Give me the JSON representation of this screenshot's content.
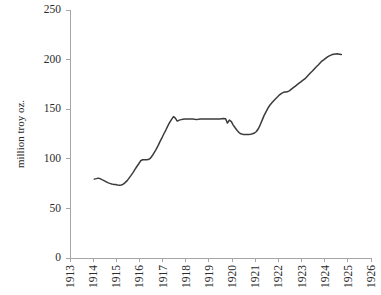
{
  "chart_data": {
    "type": "line",
    "title": "",
    "subtitle": "",
    "xlabel": "",
    "ylabel": "million troy oz.",
    "ylim": [
      0,
      250
    ],
    "xlim": [
      1913,
      1926
    ],
    "y_ticks": [
      0,
      50,
      100,
      150,
      200,
      250
    ],
    "x_ticks": [
      1913,
      1914,
      1915,
      1916,
      1917,
      1918,
      1919,
      1920,
      1921,
      1922,
      1923,
      1924,
      1925,
      1926
    ],
    "y_tick_labels": [
      "0",
      "50",
      "100",
      "150",
      "200",
      "250"
    ],
    "x_tick_labels": [
      "1913",
      "1914",
      "1915",
      "1916",
      "1917",
      "1918",
      "1919",
      "1920",
      "1921",
      "1922",
      "1923",
      "1924",
      "1925",
      "1926"
    ],
    "grid": false,
    "legend": null,
    "legend_position": "none",
    "line_color": "#3b3b3b",
    "axis_color": "#a6a6a6",
    "series": [
      {
        "name": "million troy oz.",
        "x": [
          1914.05,
          1914.14,
          1914.22,
          1914.3,
          1914.38,
          1914.47,
          1914.55,
          1914.63,
          1914.72,
          1914.8,
          1914.88,
          1914.97,
          1915.05,
          1915.14,
          1915.22,
          1915.3,
          1915.38,
          1915.47,
          1915.55,
          1915.63,
          1915.72,
          1915.8,
          1915.88,
          1915.97,
          1916.05,
          1916.14,
          1916.22,
          1916.3,
          1916.38,
          1916.47,
          1916.55,
          1916.63,
          1916.72,
          1916.8,
          1916.88,
          1916.97,
          1917.05,
          1917.14,
          1917.22,
          1917.3,
          1917.38,
          1917.47,
          1917.55,
          1917.63,
          1917.72,
          1917.8,
          1917.88,
          1917.97,
          1918.05,
          1918.14,
          1918.22,
          1918.3,
          1918.38,
          1918.47,
          1918.55,
          1918.63,
          1918.72,
          1918.8,
          1918.88,
          1918.97,
          1919.05,
          1919.14,
          1919.22,
          1919.3,
          1919.38,
          1919.47,
          1919.55,
          1919.63,
          1919.72,
          1919.8,
          1919.88,
          1919.97,
          1920.05,
          1920.14,
          1920.22,
          1920.3,
          1920.38,
          1920.47,
          1920.55,
          1920.63,
          1920.72,
          1920.8,
          1920.88,
          1920.97,
          1921.05,
          1921.14,
          1921.22,
          1921.3,
          1921.38,
          1921.47,
          1921.55,
          1921.63,
          1921.72,
          1921.8,
          1921.88,
          1921.97,
          1922.05,
          1922.14,
          1922.22,
          1922.3,
          1922.38,
          1922.47,
          1922.55,
          1922.63,
          1922.72,
          1922.8,
          1922.88,
          1922.97,
          1923.05,
          1923.14,
          1923.22,
          1923.3,
          1923.38,
          1923.47,
          1923.55,
          1923.63,
          1923.72,
          1923.8,
          1923.88,
          1923.97,
          1924.05,
          1924.14,
          1924.22,
          1924.3,
          1924.38,
          1924.47,
          1924.55,
          1924.63,
          1924.72
        ],
        "values": [
          79.5,
          80.0,
          80.5,
          80.0,
          79.0,
          78.0,
          77.0,
          76.0,
          75.2,
          74.6,
          74.2,
          74.0,
          73.6,
          73.4,
          73.6,
          74.5,
          76.0,
          78.0,
          80.5,
          83.0,
          86.0,
          89.0,
          92.0,
          95.0,
          98.0,
          99.0,
          99.0,
          99.0,
          99.2,
          100.5,
          103.0,
          106.0,
          109.5,
          113.0,
          117.0,
          121.0,
          125.0,
          129.0,
          133.0,
          136.5,
          139.5,
          142.5,
          141.0,
          138.0,
          139.0,
          139.5,
          139.8,
          140.0,
          140.0,
          140.0,
          140.0,
          140.0,
          139.8,
          139.7,
          139.8,
          140.0,
          140.0,
          140.0,
          140.0,
          140.0,
          140.0,
          140.0,
          140.0,
          140.0,
          140.0,
          140.2,
          140.4,
          140.5,
          140.3,
          136.0,
          139.0,
          137.5,
          134.0,
          131.0,
          128.5,
          126.5,
          125.2,
          124.6,
          124.4,
          124.4,
          124.5,
          124.8,
          125.2,
          126.0,
          127.5,
          130.5,
          134.5,
          139.0,
          143.5,
          147.5,
          151.0,
          154.0,
          156.5,
          158.5,
          160.5,
          162.5,
          164.5,
          166.0,
          167.0,
          167.3,
          167.5,
          168.5,
          170.0,
          171.5,
          173.0,
          174.5,
          176.0,
          177.5,
          179.0,
          180.5,
          182.5,
          184.5,
          186.5,
          188.5,
          190.5,
          192.5,
          194.5,
          196.5,
          198.5,
          200.0,
          201.5,
          203.0,
          204.0,
          204.8,
          205.3,
          205.6,
          205.8,
          205.5,
          205.2
        ]
      }
    ]
  }
}
